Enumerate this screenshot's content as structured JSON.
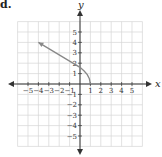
{
  "problem_label": "d.",
  "chart_data": {
    "type": "line",
    "title": "",
    "xlabel": "x",
    "ylabel": "y",
    "xlim": [
      -6,
      6
    ],
    "ylim": [
      -6,
      6
    ],
    "grid": true,
    "x_ticks": [
      "-5",
      "-4",
      "-3",
      "-2",
      "-1",
      "1",
      "2",
      "3",
      "4",
      "5"
    ],
    "y_ticks": [
      "5",
      "4",
      "3",
      "2",
      "1",
      "-1",
      "-2",
      "-3",
      "-4",
      "-5"
    ],
    "series": [
      {
        "name": "curve",
        "color": "#888888",
        "arrow_end": "left",
        "points": [
          [
            -4,
            4
          ],
          [
            -3,
            3.4
          ],
          [
            -2,
            2.8
          ],
          [
            -1,
            2.2
          ],
          [
            0,
            1.6
          ],
          [
            0.4,
            1.25
          ],
          [
            0.7,
            0.9
          ],
          [
            0.9,
            0.5
          ],
          [
            1,
            0
          ]
        ]
      }
    ]
  }
}
